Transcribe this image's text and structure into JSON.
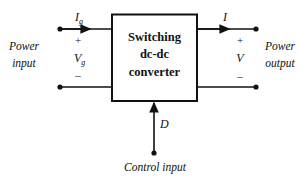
{
  "diagram": {
    "block": {
      "lines": [
        "Switching",
        "dc-dc",
        "converter"
      ]
    },
    "input": {
      "label_line1": "Power",
      "label_line2": "input",
      "current": "I",
      "current_sub": "g",
      "voltage": "V",
      "voltage_sub": "g",
      "plus": "+",
      "minus": "–"
    },
    "output": {
      "label_line1": "Power",
      "label_line2": "output",
      "current": "I",
      "voltage": "V",
      "plus": "+",
      "minus": "–"
    },
    "control": {
      "signal": "D",
      "label": "Control input"
    },
    "colors": {
      "stroke": "#111111",
      "background": "#ffffff"
    }
  }
}
